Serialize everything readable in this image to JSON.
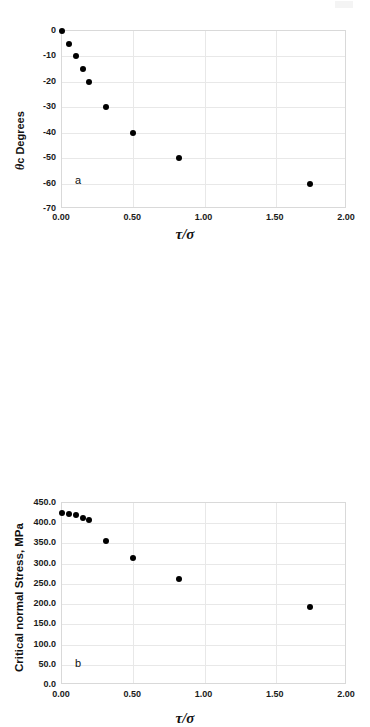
{
  "figure": {
    "background_color": "#ffffff",
    "marker_color": "#000000",
    "grid_color": "#e8e8e8",
    "frame_color": "#d9d9d9",
    "artifact_label": "scan-artifact"
  },
  "chart_data": [
    {
      "type": "scatter",
      "panel": "a",
      "panel_label": "a",
      "title": "",
      "xlabel": "τ/σ",
      "ylabel": "θc Degrees",
      "ylabel_symbol": "θ",
      "ylabel_rest": "c Degrees",
      "xlim": [
        0.0,
        2.0
      ],
      "ylim": [
        -70,
        0
      ],
      "grid": true,
      "legend": "none",
      "xticks": [
        "0.00",
        "0.50",
        "1.00",
        "1.50",
        "2.00"
      ],
      "xtick_values": [
        0.0,
        0.5,
        1.0,
        1.5,
        2.0
      ],
      "yticks": [
        "0",
        "-10",
        "-20",
        "-30",
        "-40",
        "-50",
        "-60",
        "-70"
      ],
      "ytick_values": [
        0,
        -10,
        -20,
        -30,
        -40,
        -50,
        -60,
        -70
      ],
      "x": [
        0.0,
        0.05,
        0.1,
        0.145,
        0.19,
        0.31,
        0.5,
        0.82,
        1.74
      ],
      "y": [
        0,
        -5,
        -10,
        -15,
        -20,
        -30,
        -40,
        -50,
        -60
      ]
    },
    {
      "type": "scatter",
      "panel": "b",
      "panel_label": "b",
      "title": "",
      "xlabel": "τ/σ",
      "ylabel": "Critical normal Stress, MPa",
      "xlim": [
        0.0,
        2.0
      ],
      "ylim": [
        0.0,
        450.0
      ],
      "grid": true,
      "legend": "none",
      "xticks": [
        "0.00",
        "0.50",
        "1.00",
        "1.50",
        "2.00"
      ],
      "xtick_values": [
        0.0,
        0.5,
        1.0,
        1.5,
        2.0
      ],
      "yticks": [
        "450.0",
        "400.0",
        "350.0",
        "300.0",
        "250.0",
        "200.0",
        "150.0",
        "100.0",
        "50.0",
        "0.0"
      ],
      "ytick_values": [
        450,
        400,
        350,
        300,
        250,
        200,
        150,
        100,
        50,
        0
      ],
      "x": [
        0.0,
        0.05,
        0.1,
        0.145,
        0.19,
        0.31,
        0.5,
        0.82,
        1.74
      ],
      "y": [
        426,
        424,
        420,
        414,
        408,
        357,
        313,
        261,
        192
      ]
    }
  ]
}
